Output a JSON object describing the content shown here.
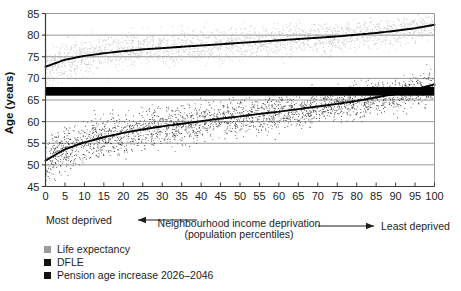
{
  "chart_data": {
    "type": "scatter",
    "title": "",
    "xlabel": "Neighbourhood income deprivation",
    "xlabel_line2": "(population percentiles)",
    "ylabel": "Age (years)",
    "xlim": [
      0,
      100
    ],
    "ylim": [
      45,
      85
    ],
    "grid": true,
    "legend_position": "below-left",
    "xticks": [
      "0",
      "5",
      "10",
      "15",
      "20",
      "25",
      "30",
      "35",
      "40",
      "45",
      "50",
      "55",
      "60",
      "65",
      "70",
      "75",
      "80",
      "85",
      "90",
      "95",
      "100"
    ],
    "yticks": [
      "45",
      "50",
      "55",
      "60",
      "65",
      "70",
      "75",
      "80",
      "85"
    ],
    "annotations": {
      "left_arrow_label": "Most deprived",
      "right_arrow_label": "Least deprived"
    },
    "legend": [
      {
        "label": "Life expectancy",
        "color": "#9a9a9a",
        "marker": "square"
      },
      {
        "label": "DFLE",
        "color": "#111111",
        "marker": "square"
      },
      {
        "label": "Pension age increase 2026–2046",
        "color": "#111111",
        "marker": "square"
      }
    ],
    "series": [
      {
        "name": "Life expectancy",
        "type": "scatter-with-trend",
        "color": "#9a9a9a",
        "trend_color": "#000000",
        "scatter_spread": 2.6,
        "n_points": 2400,
        "trend_x": [
          0,
          5,
          10,
          15,
          20,
          25,
          30,
          35,
          40,
          45,
          50,
          55,
          60,
          65,
          70,
          75,
          80,
          85,
          90,
          95,
          100
        ],
        "trend_y": [
          72.7,
          74.3,
          75.2,
          75.8,
          76.3,
          76.7,
          77.0,
          77.3,
          77.6,
          77.9,
          78.2,
          78.5,
          78.8,
          79.1,
          79.4,
          79.7,
          80.1,
          80.5,
          81.0,
          81.6,
          82.4
        ]
      },
      {
        "name": "DFLE",
        "type": "scatter-with-trend",
        "color": "#141414",
        "trend_color": "#000000",
        "scatter_spread": 3.1,
        "n_points": 2600,
        "trend_x": [
          0,
          5,
          10,
          15,
          20,
          25,
          30,
          35,
          40,
          45,
          50,
          55,
          60,
          65,
          70,
          75,
          80,
          85,
          90,
          95,
          100
        ],
        "trend_y": [
          51.0,
          53.6,
          55.2,
          56.4,
          57.4,
          58.2,
          58.9,
          59.5,
          60.1,
          60.7,
          61.2,
          61.8,
          62.3,
          62.9,
          63.5,
          64.1,
          64.8,
          65.6,
          66.4,
          67.4,
          68.6
        ]
      },
      {
        "name": "Pension age increase 2026–2046",
        "type": "band",
        "color": "#000000",
        "y_low": 66.0,
        "y_high": 68.0
      }
    ]
  }
}
